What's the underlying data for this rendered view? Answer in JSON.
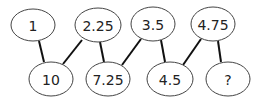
{
  "diagram": {
    "title": "",
    "nodes": [
      {
        "id": "n1",
        "label": "1",
        "cx": 33,
        "cy": 25,
        "rx": 22,
        "ry": 16
      },
      {
        "id": "n2",
        "label": "2.25",
        "cx": 98,
        "cy": 25,
        "rx": 23,
        "ry": 17
      },
      {
        "id": "n3",
        "label": "3.5",
        "cx": 153,
        "cy": 24,
        "rx": 22,
        "ry": 17
      },
      {
        "id": "n4",
        "label": "4.75",
        "cx": 213,
        "cy": 24,
        "rx": 22,
        "ry": 17
      },
      {
        "id": "n5",
        "label": "10",
        "cx": 51,
        "cy": 79,
        "rx": 22,
        "ry": 17
      },
      {
        "id": "n6",
        "label": "7.25",
        "cx": 108,
        "cy": 79,
        "rx": 22,
        "ry": 17
      },
      {
        "id": "n7",
        "label": "4.5",
        "cx": 170,
        "cy": 79,
        "rx": 23,
        "ry": 17
      },
      {
        "id": "n8",
        "label": "?",
        "cx": 228,
        "cy": 79,
        "rx": 22,
        "ry": 17
      }
    ],
    "edges": [
      {
        "from": "n1",
        "to": "n5",
        "x1": 39,
        "y1": 41,
        "x2": 44,
        "y2": 62
      },
      {
        "from": "n2",
        "to": "n5",
        "x1": 82,
        "y1": 40,
        "x2": 63,
        "y2": 64
      },
      {
        "from": "n2",
        "to": "n6",
        "x1": 100,
        "y1": 42,
        "x2": 104,
        "y2": 62
      },
      {
        "from": "n3",
        "to": "n6",
        "x1": 141,
        "y1": 39,
        "x2": 122,
        "y2": 65
      },
      {
        "from": "n3",
        "to": "n7",
        "x1": 161,
        "y1": 40,
        "x2": 165,
        "y2": 62
      },
      {
        "from": "n4",
        "to": "n7",
        "x1": 201,
        "y1": 39,
        "x2": 183,
        "y2": 65
      },
      {
        "from": "n4",
        "to": "n8",
        "x1": 218,
        "y1": 41,
        "x2": 221,
        "y2": 62
      }
    ]
  }
}
